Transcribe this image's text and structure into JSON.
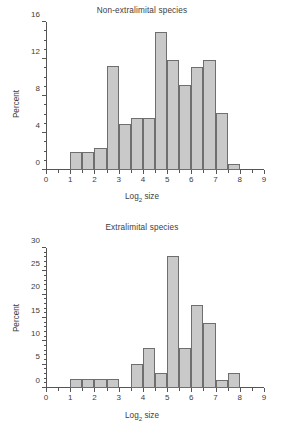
{
  "figure": {
    "axis_color": "#555555",
    "bar_fill": "#c9c9c9",
    "bar_stroke": "#6e6e6e"
  },
  "chart_data": [
    {
      "type": "bar",
      "title": "Non-extralimital species",
      "xlabel": "Log2 size",
      "xlabel_base": "Log",
      "xlabel_sub": "2",
      "xlabel_rest": " size",
      "ylabel": "Percent",
      "xlim": [
        0,
        9
      ],
      "ylim": [
        0,
        16
      ],
      "xticks": [
        0,
        1,
        2,
        3,
        4,
        5,
        6,
        7,
        8,
        9
      ],
      "xticklabels": [
        "0",
        "1",
        "2",
        "3",
        "4",
        "5",
        "6",
        "7",
        "8",
        "9"
      ],
      "yticks": [
        0,
        4,
        8,
        12,
        16
      ],
      "yticklabels": [
        "0",
        "4",
        "8",
        "12",
        "16"
      ],
      "y_minor_step": 1,
      "x_minor_step": 0.5,
      "grid": false,
      "legend": "none",
      "bin_width": 0.5,
      "bin_starts": [
        1.0,
        1.5,
        2.0,
        2.5,
        3.0,
        3.5,
        4.0,
        4.5,
        5.0,
        5.5,
        6.0,
        6.5,
        7.0,
        7.5
      ],
      "values": [
        1.9,
        1.9,
        2.4,
        11.2,
        5.0,
        5.6,
        5.6,
        14.9,
        11.9,
        9.2,
        11.1,
        11.9,
        6.2,
        0.6
      ]
    },
    {
      "type": "bar",
      "title": "Extralimital species",
      "xlabel": "Log2 size",
      "xlabel_base": "Log",
      "xlabel_sub": "2",
      "xlabel_rest": " size",
      "ylabel": "Percent",
      "xlim": [
        0,
        9
      ],
      "ylim": [
        0,
        30
      ],
      "xticks": [
        0,
        1,
        2,
        3,
        4,
        5,
        6,
        7,
        8,
        9
      ],
      "xticklabels": [
        "0",
        "1",
        "2",
        "3",
        "4",
        "5",
        "6",
        "7",
        "8",
        "9"
      ],
      "yticks": [
        0,
        5,
        10,
        15,
        20,
        25,
        30
      ],
      "yticklabels": [
        "0",
        "5",
        "10",
        "15",
        "20",
        "25",
        "30"
      ],
      "y_minor_step": 1,
      "x_minor_step": 0.5,
      "grid": false,
      "legend": "none",
      "bin_width": 0.5,
      "bin_starts": [
        1.0,
        1.5,
        2.0,
        2.5,
        3.5,
        4.0,
        4.5,
        5.0,
        5.5,
        6.0,
        6.5,
        7.0,
        7.5
      ],
      "values": [
        2.0,
        2.0,
        2.0,
        2.0,
        5.2,
        8.6,
        3.2,
        28.3,
        8.5,
        17.7,
        14.0,
        1.7,
        3.2
      ]
    }
  ]
}
